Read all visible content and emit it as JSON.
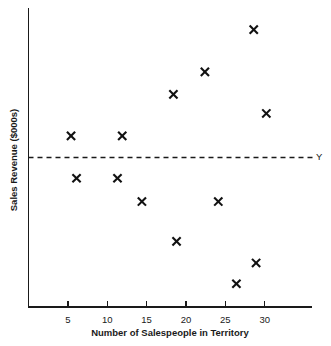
{
  "chart_data": {
    "type": "scatter",
    "title": "",
    "xlabel": "Number of Salespeople in Territory",
    "ylabel": "Sales Revenue ($000s)",
    "xticks": [
      "5",
      "10",
      "15",
      "20",
      "25",
      "30"
    ],
    "xtick_values": [
      5,
      10,
      15,
      20,
      25,
      30
    ],
    "yticks": [],
    "xlim": [
      0,
      36
    ],
    "ylim": [
      0,
      36
    ],
    "grid": false,
    "legend": false,
    "marker": "x",
    "marker_color": "#111111",
    "annotations": [
      {
        "name": "reference-line-label",
        "label": "Y",
        "type": "horizontal-reference-line",
        "y": 18,
        "style": "dashed"
      }
    ],
    "points": [
      {
        "x": 5.4,
        "y": 20.6
      },
      {
        "x": 6.1,
        "y": 15.5
      },
      {
        "x": 11.3,
        "y": 15.5
      },
      {
        "x": 11.9,
        "y": 20.6
      },
      {
        "x": 14.4,
        "y": 12.7
      },
      {
        "x": 18.4,
        "y": 25.6
      },
      {
        "x": 18.8,
        "y": 7.9
      },
      {
        "x": 22.4,
        "y": 28.3
      },
      {
        "x": 24.1,
        "y": 12.7
      },
      {
        "x": 26.4,
        "y": 2.8
      },
      {
        "x": 28.6,
        "y": 33.4
      },
      {
        "x": 28.9,
        "y": 5.3
      },
      {
        "x": 30.2,
        "y": 23.3
      }
    ]
  },
  "colors": {
    "axis": "#1a1a1a",
    "marker": "#111111",
    "background": "#ffffff"
  }
}
